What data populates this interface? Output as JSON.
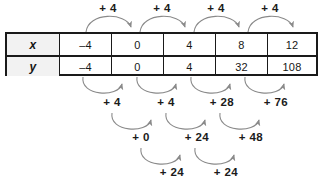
{
  "figure": {
    "type": "finite-differences-table",
    "table": {
      "rows": [
        {
          "label": "x",
          "values": [
            "–4",
            "0",
            "4",
            "8",
            "12"
          ]
        },
        {
          "label": "y",
          "values": [
            "–4",
            "0",
            "4",
            "32",
            "108"
          ]
        }
      ]
    },
    "arrow_rows": [
      {
        "name": "x-differences",
        "position": "above-table",
        "labels": [
          "+ 4",
          "+ 4",
          "+ 4",
          "+ 4"
        ]
      },
      {
        "name": "first-differences",
        "position": "below-table",
        "labels": [
          "+ 4",
          "+ 4",
          "+ 28",
          "+ 76"
        ]
      },
      {
        "name": "second-differences",
        "position": "below-first",
        "labels": [
          "+ 0",
          "+ 24",
          "+ 48"
        ]
      },
      {
        "name": "third-differences",
        "position": "below-second",
        "labels": [
          "+ 24",
          "+ 24"
        ]
      }
    ],
    "colors": {
      "arrow": "#8a8a8a",
      "border": "#1a1a1a",
      "label_cell_bg": "#f2f2f2",
      "text": "#161616",
      "background": "#ffffff"
    }
  }
}
